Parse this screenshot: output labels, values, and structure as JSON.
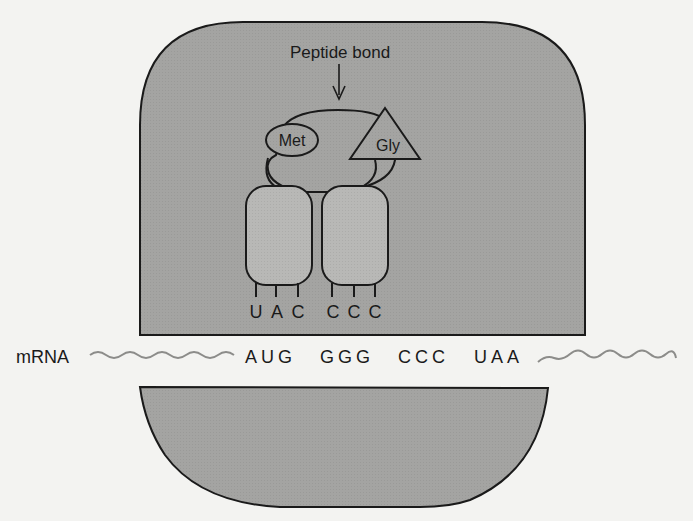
{
  "diagram": {
    "type": "ribosome-translation",
    "colors": {
      "background": "#f3f3f1",
      "subunit_fill": "#a4a4a2",
      "trna_fill": "#b9b9b7",
      "outline": "#1a1a1a",
      "mrna_wave": "#8c8c8a",
      "text": "#1a1a1a"
    },
    "labels": {
      "peptide_bond": "Peptide bond",
      "amino_acid_1": "Met",
      "amino_acid_2": "Gly",
      "mrna": "mRNA"
    },
    "trna": [
      {
        "amino_acid": "Met",
        "anticodon": [
          "U",
          "A",
          "C"
        ]
      },
      {
        "amino_acid": "Gly",
        "anticodon": [
          "C",
          "C",
          "C"
        ]
      }
    ],
    "mrna": {
      "codons": [
        "AUG",
        "GGG",
        "CCC",
        "UAA"
      ],
      "sequence_text": "A U G  G G G  C C C  U A A"
    },
    "components": {
      "large_subunit": "large ribosomal subunit",
      "small_subunit": "small ribosomal subunit"
    }
  }
}
